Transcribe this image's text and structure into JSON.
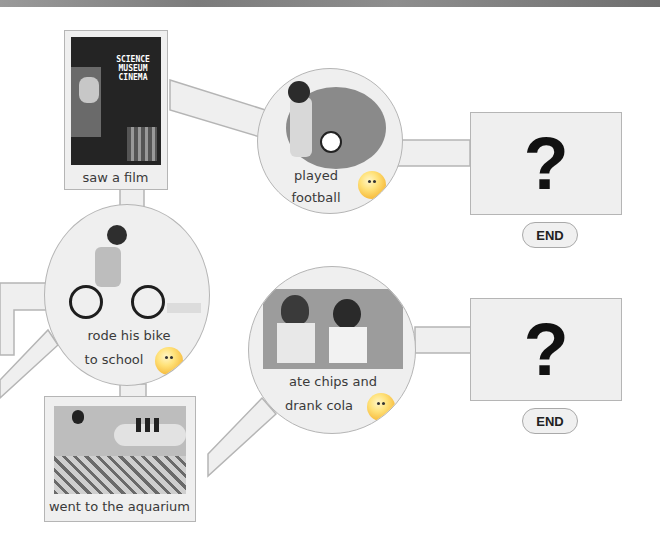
{
  "story_map": {
    "nodes": {
      "saw_film": {
        "label": "saw a film",
        "poster_text": [
          "SCIENCE",
          "MUSEUM",
          "CINEMA"
        ]
      },
      "played_football": {
        "label_line1": "played",
        "label_line2": "football"
      },
      "rode_bike": {
        "label_line1": "rode his bike",
        "label_line2": "to school"
      },
      "ate_chips": {
        "label_line1": "ate chips and",
        "label_line2": "drank cola"
      },
      "aquarium": {
        "label": "went to the aquarium"
      }
    },
    "endings": [
      {
        "symbol": "?",
        "button": "END"
      },
      {
        "symbol": "?",
        "button": "END"
      }
    ]
  },
  "colors": {
    "panel": "#efefef",
    "border": "#b5b5b5",
    "face": "#f6b93a"
  }
}
